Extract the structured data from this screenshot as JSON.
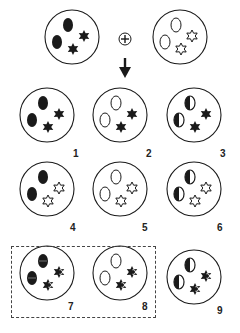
{
  "colors": {
    "ink": "#1a1a1a",
    "paper": "#ffffff",
    "dash": "#444444"
  },
  "operator": {
    "symbol": "+",
    "icon": "circled-plus-icon"
  },
  "arrow": {
    "icon": "down-arrow-icon"
  },
  "parents": [
    {
      "id": "parent-a",
      "ovals": "filled",
      "stars": "filled"
    },
    {
      "id": "parent-b",
      "ovals": "empty",
      "stars": "empty"
    }
  ],
  "options": [
    {
      "label": "1",
      "ovals": "filled",
      "stars": "filled"
    },
    {
      "label": "2",
      "ovals": "empty",
      "stars": "filled"
    },
    {
      "label": "3",
      "ovals": "half",
      "stars": "filled"
    },
    {
      "label": "4",
      "ovals": "filled",
      "stars": "empty"
    },
    {
      "label": "5",
      "ovals": "empty",
      "stars": "empty"
    },
    {
      "label": "6",
      "ovals": "half",
      "stars": "empty"
    },
    {
      "label": "7",
      "ovals": "striped",
      "stars": "half",
      "highlighted": true
    },
    {
      "label": "8",
      "ovals": "empty",
      "stars": "half",
      "highlighted": true
    },
    {
      "label": "9",
      "ovals": "half",
      "stars": "half"
    }
  ],
  "highlight_group": {
    "labels": [
      "7",
      "8"
    ],
    "style": "dashed"
  }
}
